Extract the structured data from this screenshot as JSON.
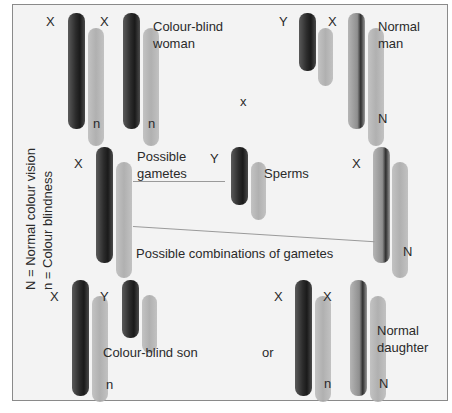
{
  "diagram": {
    "legend": {
      "line1": "N = Normal colour vision",
      "line2": "n  = Colour blindness"
    },
    "parents": {
      "mother": {
        "label_line1": "Colour-blind",
        "label_line2": "woman",
        "chromosomes": [
          {
            "type": "X",
            "allele": "n"
          },
          {
            "type": "X",
            "allele": "n"
          }
        ]
      },
      "cross_symbol": "x",
      "father": {
        "label_line1": "Normal",
        "label_line2": "man",
        "chromosomes": [
          {
            "type": "Y",
            "allele": ""
          },
          {
            "type": "X",
            "allele": "N"
          }
        ]
      }
    },
    "gametes": {
      "egg_label": "X",
      "possible_gametes_line1": "Possible",
      "possible_gametes_line2": "gametes",
      "sperm_y_label": "Y",
      "sperms_label": "Sperms",
      "sperm_x_label": "X",
      "sperm_x_allele": "N",
      "combinations_label": "Possible combinations of gametes"
    },
    "offspring": {
      "son": {
        "label": "Colour-blind son",
        "chromosomes": [
          {
            "type": "X",
            "allele": "n"
          },
          {
            "type": "Y",
            "allele": ""
          }
        ]
      },
      "or_label": "or",
      "daughter": {
        "label_line1": "Normal",
        "label_line2": "daughter",
        "chromosomes": [
          {
            "type": "X",
            "allele": "n"
          },
          {
            "type": "X",
            "allele": "N"
          }
        ]
      }
    }
  }
}
